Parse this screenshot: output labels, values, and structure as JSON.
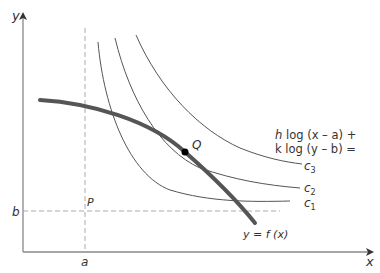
{
  "diagram": {
    "type": "indifference-curves-with-constraint",
    "axes": {
      "x_label": "x",
      "y_label": "y",
      "x_tick_label": "a",
      "y_tick_label": "b"
    },
    "points": {
      "P": "P",
      "Q": "Q"
    },
    "constraint_label": "y = f (x)",
    "objective_label_line1": "h log (x – a) +",
    "objective_label_line2": "k log (y – b) =",
    "contour_labels": {
      "c1": "c",
      "c1_sub": "1",
      "c2": "c",
      "c2_sub": "2",
      "c3": "c",
      "c3_sub": "3"
    },
    "colors": {
      "axis": "#888888",
      "thin_curve": "#555555",
      "thick_curve": "#555555",
      "dashed": "#aaaaaa",
      "point": "#000000",
      "text": "#333333"
    }
  }
}
